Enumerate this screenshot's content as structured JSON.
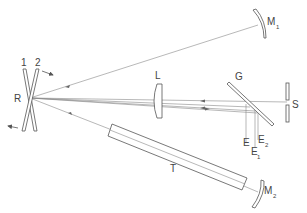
{
  "diagram": {
    "type": "optical setup schematic",
    "colors": {
      "line": "#555555",
      "ray": "#888888",
      "text": "#444444",
      "background": "#ffffff"
    },
    "labels": {
      "plate1": "1",
      "plate2": "2",
      "reflector": "R",
      "lens": "L",
      "grating": "G",
      "slit": "S",
      "mirror1": "M",
      "mirror1_sub": "1",
      "mirror2": "M",
      "mirror2_sub": "2",
      "tube": "T",
      "e": "E",
      "e1": "E",
      "e1_sub": "1",
      "e2": "E",
      "e2_sub": "2"
    }
  }
}
